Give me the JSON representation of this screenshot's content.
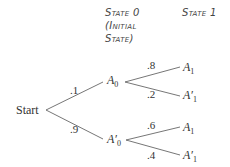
{
  "headers": {
    "state0_line1": "State 0",
    "state0_line2": "(Initial",
    "state0_line3": "State)",
    "state1": "State 1"
  },
  "root": {
    "label": "Start"
  },
  "state0_nodes": [
    {
      "label": "A",
      "prime": "",
      "sub": "0",
      "prob_from_start": ".1"
    },
    {
      "label": "A",
      "prime": "′",
      "sub": "0",
      "prob_from_start": ".9"
    }
  ],
  "state1_nodes": [
    {
      "label": "A",
      "prime": "",
      "sub": "1",
      "prob": ".8",
      "parent": "A0"
    },
    {
      "label": "A",
      "prime": "′",
      "sub": "1",
      "prob": ".2",
      "parent": "A0"
    },
    {
      "label": "A",
      "prime": "",
      "sub": "1",
      "prob": ".6",
      "parent": "A'0"
    },
    {
      "label": "A",
      "prime": "′",
      "sub": "1",
      "prob": ".4",
      "parent": "A'0"
    }
  ],
  "colors": {
    "line": "#555555",
    "text": "#333333"
  }
}
